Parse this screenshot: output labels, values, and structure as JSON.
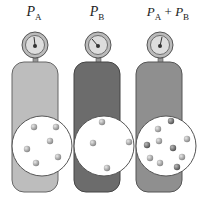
{
  "tanks": [
    {
      "id": "A",
      "label": "P",
      "sub": "A",
      "color": "#b8b8b8",
      "particles": [
        [
          34,
          68
        ],
        [
          56,
          67
        ],
        [
          50,
          81
        ],
        [
          27,
          89
        ],
        [
          36,
          103
        ],
        [
          58,
          97
        ]
      ],
      "particle_color": "#a8a8a8"
    },
    {
      "id": "B",
      "label": "P",
      "sub": "B",
      "color": "#6a6a6a",
      "particles": [
        [
          102,
          62
        ],
        [
          93,
          83
        ],
        [
          129,
          82
        ],
        [
          107,
          108
        ]
      ],
      "particle_color": "#8a8a8a"
    },
    {
      "id": "AB",
      "label": "P",
      "sub": "A + P",
      "sub2": "B",
      "color": "#8e8e8e",
      "particles": [
        [
          171,
          61
        ],
        [
          158,
          69
        ],
        [
          187,
          79
        ],
        [
          147,
          85
        ],
        [
          159,
          81
        ],
        [
          173,
          88
        ],
        [
          150,
          98
        ],
        [
          181,
          97
        ],
        [
          160,
          103
        ],
        [
          177,
          107
        ]
      ],
      "particle_color": "#999999"
    }
  ],
  "labels": {
    "a": "P",
    "a_sub": "A",
    "b": "P",
    "b_sub": "B",
    "c1": "P",
    "c1_sub": "A",
    "plus": "+",
    "c2": "P",
    "c2_sub": "B"
  }
}
